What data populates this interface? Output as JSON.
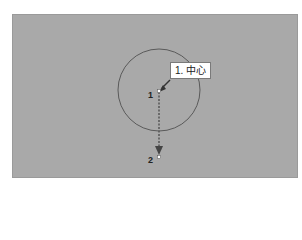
{
  "canvas": {
    "background": "#a9a9a9",
    "circle": {
      "cx": 159,
      "cy": 90,
      "r": 41,
      "stroke": "#5a5a5a"
    },
    "points": [
      {
        "id": "1",
        "label": "1",
        "x": 159,
        "y": 91
      },
      {
        "id": "2",
        "label": "2",
        "x": 159,
        "y": 157
      }
    ],
    "tooltip": {
      "text": "1. 中心"
    }
  }
}
